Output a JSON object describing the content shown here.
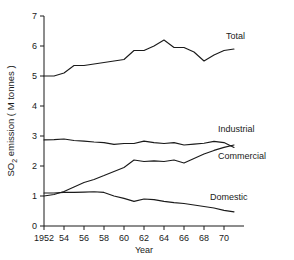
{
  "chart_data": {
    "type": "line",
    "title": "",
    "xlabel": "Year",
    "ylabel": "SO2 emission ( M tonnes )",
    "ylabel_parts": {
      "pre": "SO",
      "sub": "2",
      "post": " emission ( M tonnes )"
    },
    "x": [
      1952,
      1953,
      1954,
      1955,
      1956,
      1957,
      1958,
      1959,
      1960,
      1961,
      1962,
      1963,
      1964,
      1965,
      1966,
      1967,
      1968,
      1969,
      1970,
      1971
    ],
    "xtick_values": [
      1952,
      1954,
      1956,
      1958,
      1960,
      1962,
      1964,
      1966,
      1968,
      1970
    ],
    "xtick_labels": [
      "1952",
      "54",
      "56",
      "58",
      "60",
      "62",
      "64",
      "66",
      "68",
      "70"
    ],
    "ytick_values": [
      0,
      1,
      2,
      3,
      4,
      5,
      6,
      7
    ],
    "ytick_labels": [
      "0",
      "1",
      "2",
      "3",
      "4",
      "5",
      "6",
      "7"
    ],
    "xlim": [
      1952,
      1972
    ],
    "ylim": [
      0,
      7
    ],
    "grid": false,
    "legend_position": "inline-right",
    "series": [
      {
        "name": "Total",
        "label": "Total",
        "values": [
          5.0,
          5.0,
          5.1,
          5.35,
          5.35,
          5.4,
          5.45,
          5.5,
          5.55,
          5.85,
          5.85,
          6.0,
          6.2,
          5.95,
          5.95,
          5.8,
          5.5,
          5.7,
          5.85,
          5.9
        ]
      },
      {
        "name": "Industrial",
        "label": "Industrial",
        "values": [
          2.87,
          2.88,
          2.9,
          2.85,
          2.83,
          2.8,
          2.78,
          2.72,
          2.75,
          2.75,
          2.83,
          2.78,
          2.75,
          2.78,
          2.7,
          2.73,
          2.76,
          2.82,
          2.78,
          2.62
        ]
      },
      {
        "name": "Commercial",
        "label": "Commercial",
        "values": [
          1.0,
          1.05,
          1.15,
          1.3,
          1.45,
          1.55,
          1.68,
          1.82,
          1.95,
          2.2,
          2.15,
          2.17,
          2.15,
          2.2,
          2.1,
          2.25,
          2.4,
          2.52,
          2.62,
          2.7
        ]
      },
      {
        "name": "Domestic",
        "label": "Domestic",
        "values": [
          1.1,
          1.1,
          1.12,
          1.12,
          1.13,
          1.14,
          1.12,
          1.0,
          0.92,
          0.82,
          0.9,
          0.88,
          0.82,
          0.78,
          0.75,
          0.7,
          0.65,
          0.6,
          0.52,
          0.47
        ]
      }
    ],
    "series_label_anchors": [
      {
        "name": "Total",
        "x": 1970.2,
        "y": 6.25
      },
      {
        "name": "Industrial",
        "x": 1969.4,
        "y": 3.15
      },
      {
        "name": "Commercial",
        "x": 1969.4,
        "y": 2.25
      },
      {
        "name": "Domestic",
        "x": 1968.6,
        "y": 0.88
      }
    ]
  }
}
